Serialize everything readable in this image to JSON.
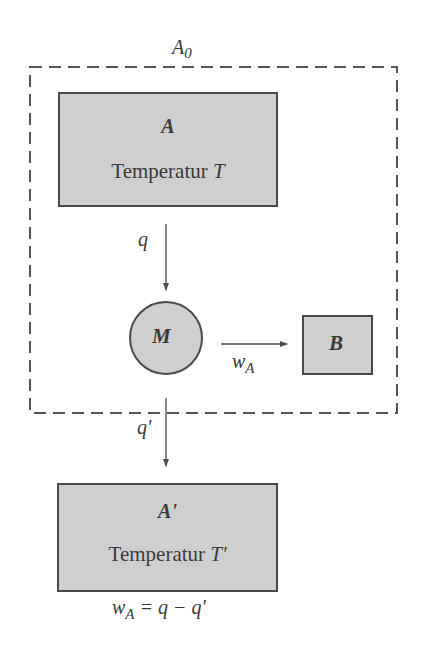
{
  "diagram": {
    "system_boundary": {
      "label": "A",
      "label_subscript": "0"
    },
    "reservoir_top": {
      "name": "A",
      "temp_label": "Temperatur",
      "temp_symbol": "T"
    },
    "machine": {
      "name": "M"
    },
    "work_body": {
      "name": "B"
    },
    "reservoir_bottom": {
      "name": "A'",
      "temp_label": "Temperatur",
      "temp_symbol": "T'"
    },
    "flows": {
      "heat_in": "q",
      "heat_out": "q'",
      "work": {
        "symbol": "w",
        "subscript": "A"
      }
    },
    "equation": {
      "lhs": "w",
      "lhs_subscript": "A",
      "rhs": "= q − q'"
    },
    "colors": {
      "fill": "#cfcfcf",
      "stroke": "#4a4a4a",
      "background": "#ffffff"
    }
  }
}
